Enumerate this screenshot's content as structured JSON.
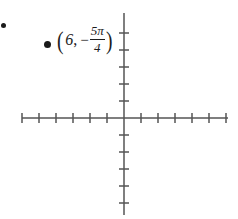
{
  "figure": {
    "title": "",
    "background_color": "#ffffff",
    "axis_color": "#555555",
    "marker_color": "#1a1a1a",
    "text_color": "#1c1c1c",
    "bullet": {
      "name": "list-bullet",
      "x": 3,
      "y": 25
    }
  },
  "label": {
    "full_text": "(6, -5π/4)",
    "open_paren": "(",
    "radius": "6",
    "comma": ",",
    "minus": "−",
    "numerator": "5π",
    "denominator": "4",
    "close_paren": ")",
    "x": 56,
    "y": 38
  },
  "chart_data": {
    "type": "scatter",
    "title": "",
    "xlabel": "",
    "ylabel": "",
    "grid": false,
    "legend": null,
    "coordinate_system": "cartesian-axes-with-ticks",
    "origin_px": [
      124,
      118
    ],
    "tick_spacing_px": 17,
    "xlim": [
      -6,
      6
    ],
    "ylim": [
      -5,
      5
    ],
    "x_tick_count_negative": 6,
    "x_tick_count_positive": 6,
    "y_tick_count_positive": 5,
    "y_tick_count_negative": 5,
    "x_ticks": [
      -6,
      -5,
      -4,
      -3,
      -2,
      -1,
      1,
      2,
      3,
      4,
      5,
      6
    ],
    "y_ticks": [
      -5,
      -4,
      -3,
      -2,
      -1,
      1,
      2,
      3,
      4,
      5
    ],
    "xtick_labels": [],
    "ytick_labels": [],
    "axis_extent_px": {
      "x_start": 22,
      "x_end": 228,
      "y_start": 13,
      "y_end": 215
    },
    "points": [
      {
        "label": "(6, -5π/4)",
        "polar_r": 6,
        "polar_theta": "-5π/4",
        "px": [
          47,
          44
        ]
      }
    ]
  }
}
